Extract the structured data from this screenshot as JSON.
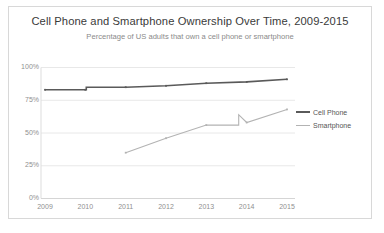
{
  "chart_data": {
    "type": "line",
    "title": "Cell Phone and Smartphone Ownership Over Time, 2009-2015",
    "subtitle": "Percentage of US adults that own a cell phone or smartphone",
    "xlabel": "",
    "ylabel": "",
    "categories": [
      "2009",
      "2010",
      "2011",
      "2012",
      "2013",
      "2014",
      "2015"
    ],
    "x": [
      2009,
      2010,
      2011,
      2012,
      2013,
      2014,
      2015
    ],
    "ylim": [
      0,
      100
    ],
    "yticks": [
      0,
      25,
      50,
      75,
      100
    ],
    "ytick_labels": [
      "0%",
      "25%",
      "50%",
      "75%",
      "100%"
    ],
    "grid": true,
    "legend_position": "right",
    "series": [
      {
        "name": "Cell Phone",
        "color": "#5a5a5a",
        "width": 1.6,
        "values": [
          83,
          83,
          85,
          86,
          88,
          89,
          91
        ],
        "step_at": 2010
      },
      {
        "name": "Smartphone",
        "color": "#b3b3b3",
        "width": 1.1,
        "values": [
          null,
          null,
          35,
          46,
          56,
          58,
          68
        ],
        "step_at": 2014,
        "step_to": 64
      }
    ],
    "annotations": [
      "Smartphone series begins in 2011",
      "Smartphone series shows a vertical step up just before 2014"
    ]
  },
  "legend": {
    "items": [
      {
        "label": "Cell Phone",
        "color": "#5a5a5a",
        "thickness": "2px"
      },
      {
        "label": "Smartphone",
        "color": "#b3b3b3",
        "thickness": "1px"
      }
    ]
  },
  "axis": {
    "y_labels": [
      "100%",
      "75%",
      "50%",
      "25%",
      "0%"
    ],
    "x_labels": [
      "2009",
      "2010",
      "2011",
      "2012",
      "2013",
      "2014",
      "2015"
    ]
  }
}
